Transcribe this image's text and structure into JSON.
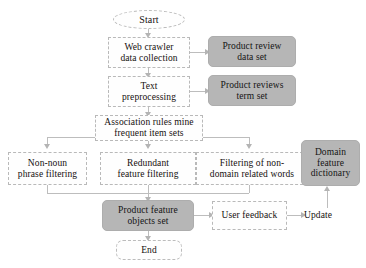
{
  "diagram": {
    "colors": {
      "data_fill": "#b6b6b6",
      "process_border": "#b9b9b9",
      "connector": "#bdbdbd",
      "text": "#15100e"
    },
    "nodes": {
      "start": {
        "label": "Start",
        "shape": "oval"
      },
      "web_crawler": {
        "label": "Web crawler\ndata collection",
        "shape": "process"
      },
      "product_review_data_set": {
        "label": "Product review\ndata set",
        "shape": "data"
      },
      "text_preprocessing": {
        "label": "Text\npreprocessing",
        "shape": "process"
      },
      "product_reviews_term_set": {
        "label": "Product reviews\nterm set",
        "shape": "data"
      },
      "association_rules": {
        "label": "Association rules mine\nfrequent item sets",
        "shape": "process"
      },
      "non_noun_phrase_filtering": {
        "label": "Non-noun\nphrase filtering",
        "shape": "process"
      },
      "redundant_feature_filtering": {
        "label": "Redundant\nfeature filtering",
        "shape": "process"
      },
      "filtering_non_domain_words": {
        "label": "Filtering of non-\ndomain related words",
        "shape": "process"
      },
      "domain_feature_dictionary": {
        "label": "Domain\nfeature\ndictionary",
        "shape": "data"
      },
      "product_feature_objects_set": {
        "label": "Product feature\nobjects set",
        "shape": "data"
      },
      "user_feedback": {
        "label": "User feedback",
        "shape": "process"
      },
      "update": {
        "label": "Update",
        "shape": "plain-label"
      },
      "end": {
        "label": "End",
        "shape": "rounded-terminator"
      }
    }
  }
}
